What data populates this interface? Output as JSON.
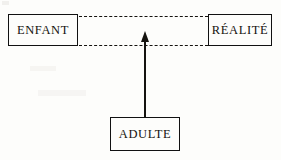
{
  "diagram": {
    "background_color": "#fdfdfb",
    "line_color": "#15130f",
    "nodes": [
      {
        "id": "enfant",
        "label": "ENFANT",
        "shape": "rectangle",
        "x": 8,
        "y": 14,
        "width": 70,
        "height": 32
      },
      {
        "id": "realite",
        "label": "RÉALITÉ",
        "shape": "rectangle",
        "x": 208,
        "y": 14,
        "width": 64,
        "height": 32
      },
      {
        "id": "adulte",
        "label": "ADULTE",
        "shape": "rectangle",
        "x": 110,
        "y": 117,
        "width": 70,
        "height": 34
      }
    ],
    "connectors": [
      {
        "id": "dashed-top",
        "style": "dashed",
        "from": "enfant",
        "to": "realite",
        "arrow": "none",
        "y": 16
      },
      {
        "id": "dashed-bottom",
        "style": "dashed",
        "from": "enfant",
        "to": "realite",
        "arrow": "none",
        "y": 45
      },
      {
        "id": "adulte-arrow",
        "style": "solid",
        "from": "adulte",
        "to": "dashed-top",
        "arrow": "up",
        "x": 145
      }
    ]
  }
}
